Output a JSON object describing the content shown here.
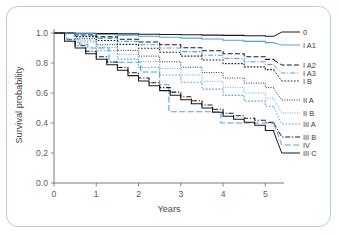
{
  "figure": {
    "border_color": "#a9cfe8",
    "background": "#ffffff"
  },
  "chart_data": {
    "type": "line",
    "subtype": "kaplan-meier-survival",
    "title": "",
    "xlabel": "Years",
    "ylabel": "Survival probability",
    "xlim": [
      0,
      5.3
    ],
    "ylim": [
      0.0,
      1.0
    ],
    "xticks": [
      0,
      1,
      2,
      3,
      4,
      5
    ],
    "xtick_labels": [
      "0",
      "1",
      "2",
      "3",
      "4",
      "5"
    ],
    "yticks": [
      0.0,
      0.2,
      0.4,
      0.6,
      0.8,
      1.0
    ],
    "ytick_labels": [
      "0.0",
      "0.2",
      "0.4",
      "0.6",
      "0.8",
      "1.0"
    ],
    "grid": false,
    "legend_position": "right-outside",
    "colors": {
      "black": "#1a1a1a",
      "blue": "#4fa3d8"
    },
    "series": [
      {
        "name": "0",
        "label": "0",
        "color": "#1a1a1a",
        "dash": "none",
        "x": [
          0,
          0.5,
          1,
          1.5,
          2,
          2.5,
          3,
          3.5,
          4,
          4.5,
          5,
          5.2
        ],
        "values": [
          1.0,
          0.998,
          0.996,
          0.994,
          0.992,
          0.99,
          0.988,
          0.986,
          0.984,
          0.982,
          0.978,
          0.977
        ]
      },
      {
        "name": "I A1",
        "label": "I A1",
        "color": "#4fa3d8",
        "dash": "none",
        "x": [
          0,
          0.5,
          1,
          1.5,
          2,
          2.5,
          3,
          3.5,
          4,
          4.5,
          5,
          5.2
        ],
        "values": [
          1.0,
          0.995,
          0.99,
          0.985,
          0.978,
          0.972,
          0.966,
          0.96,
          0.952,
          0.944,
          0.936,
          0.934
        ]
      },
      {
        "name": "I A2",
        "label": "I A2",
        "color": "#1a1a1a",
        "dash": "dashed-long",
        "x": [
          0,
          0.5,
          1,
          1.5,
          2,
          2.5,
          3,
          3.5,
          4,
          4.5,
          5,
          5.2
        ],
        "values": [
          1.0,
          0.987,
          0.974,
          0.958,
          0.94,
          0.922,
          0.902,
          0.882,
          0.862,
          0.842,
          0.824,
          0.82
        ]
      },
      {
        "name": "I A3",
        "label": "I A3",
        "color": "#4fa3d8",
        "dash": "dash-dot",
        "x": [
          0,
          0.5,
          1,
          1.5,
          2,
          2.5,
          3,
          3.5,
          4,
          4.5,
          5,
          5.2
        ],
        "values": [
          1.0,
          0.982,
          0.964,
          0.944,
          0.922,
          0.9,
          0.876,
          0.852,
          0.83,
          0.808,
          0.79,
          0.786
        ]
      },
      {
        "name": "I B",
        "label": "I B",
        "color": "#1a1a1a",
        "dash": "dotted",
        "x": [
          0,
          0.5,
          1,
          1.5,
          2,
          2.5,
          3,
          3.5,
          4,
          4.5,
          5,
          5.2
        ],
        "values": [
          1.0,
          0.976,
          0.95,
          0.924,
          0.898,
          0.872,
          0.846,
          0.82,
          0.796,
          0.774,
          0.756,
          0.752
        ]
      },
      {
        "name": "II A",
        "label": "II A",
        "color": "#1a1a1a",
        "dash": "dotted-fine",
        "x": [
          0,
          0.5,
          1,
          1.5,
          2,
          2.5,
          3,
          3.5,
          4,
          4.5,
          5,
          5.2
        ],
        "values": [
          1.0,
          0.962,
          0.922,
          0.884,
          0.846,
          0.808,
          0.772,
          0.736,
          0.7,
          0.666,
          0.636,
          0.63
        ]
      },
      {
        "name": "II B",
        "label": "II B",
        "color": "#4fa3d8",
        "dash": "dotted-fine",
        "x": [
          0,
          0.5,
          1,
          1.5,
          2,
          2.5,
          3,
          3.5,
          4,
          4.5,
          5,
          5.2
        ],
        "values": [
          1.0,
          0.952,
          0.904,
          0.856,
          0.81,
          0.764,
          0.72,
          0.678,
          0.638,
          0.6,
          0.566,
          0.558
        ]
      },
      {
        "name": "III A",
        "label": "III A",
        "color": "#4fa3d8",
        "dash": "dotted",
        "x": [
          0,
          0.5,
          1,
          1.5,
          2,
          2.5,
          3,
          3.5,
          4,
          4.5,
          5,
          5.2
        ],
        "values": [
          1.0,
          0.94,
          0.882,
          0.826,
          0.772,
          0.72,
          0.672,
          0.626,
          0.584,
          0.546,
          0.512,
          0.505
        ]
      },
      {
        "name": "III B",
        "label": "III B",
        "color": "#1a1a1a",
        "dash": "dash-dot",
        "x": [
          0,
          0.25,
          0.5,
          0.75,
          1,
          1.25,
          1.5,
          1.75,
          2,
          2.25,
          2.5,
          2.75,
          3,
          3.25,
          3.5,
          3.75,
          4,
          4.25,
          4.5,
          4.75,
          5,
          5.2
        ],
        "values": [
          1.0,
          0.955,
          0.915,
          0.878,
          0.842,
          0.806,
          0.77,
          0.735,
          0.7,
          0.668,
          0.636,
          0.606,
          0.575,
          0.548,
          0.52,
          0.492,
          0.465,
          0.448,
          0.432,
          0.418,
          0.404,
          0.4
        ]
      },
      {
        "name": "IV",
        "label": "IV",
        "color": "#4fa3d8",
        "dash": "dash-long-step",
        "x": [
          0,
          0.3,
          0.6,
          0.8,
          1.3,
          1.3,
          2.05,
          2.05,
          2.5,
          2.5,
          2.72,
          2.72,
          3.95,
          3.95,
          4.6,
          5.2
        ],
        "values": [
          1.0,
          0.96,
          0.925,
          0.9,
          0.9,
          0.805,
          0.805,
          0.74,
          0.74,
          0.655,
          0.655,
          0.475,
          0.475,
          0.4,
          0.4,
          0.395
        ]
      },
      {
        "name": "III C",
        "label": "III C",
        "color": "#1a1a1a",
        "dash": "none",
        "x": [
          0,
          0.25,
          0.5,
          0.75,
          1,
          1.25,
          1.5,
          1.75,
          2,
          2.25,
          2.5,
          2.75,
          3,
          3.25,
          3.5,
          3.75,
          4,
          4.25,
          4.5,
          4.75,
          5,
          5.2
        ],
        "values": [
          1.0,
          0.945,
          0.9,
          0.862,
          0.825,
          0.788,
          0.752,
          0.716,
          0.68,
          0.648,
          0.616,
          0.585,
          0.555,
          0.528,
          0.5,
          0.472,
          0.445,
          0.425,
          0.405,
          0.385,
          0.35,
          0.34
        ]
      }
    ]
  },
  "legend": {
    "entries": [
      {
        "label": "0"
      },
      {
        "label": "I A1"
      },
      {
        "label": "I A2"
      },
      {
        "label": "I A3"
      },
      {
        "label": "I B"
      },
      {
        "label": "II A"
      },
      {
        "label": "II B"
      },
      {
        "label": "III A"
      },
      {
        "label": "III B"
      },
      {
        "label": "IV"
      },
      {
        "label": "III C"
      }
    ]
  }
}
